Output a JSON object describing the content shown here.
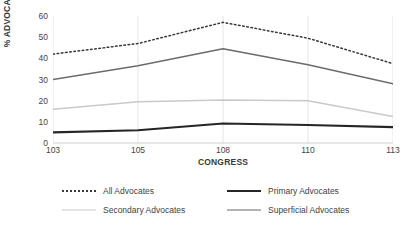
{
  "chart_data": {
    "type": "line",
    "title": "",
    "xlabel": "CONGRESS",
    "ylabel": "% ADVOCATES",
    "categories": [
      "103",
      "105",
      "108",
      "110",
      "113"
    ],
    "ylim": [
      0,
      60
    ],
    "yticks": [
      0,
      10,
      20,
      30,
      40,
      50,
      60
    ],
    "grid": "vertical",
    "legend_position": "bottom",
    "series": [
      {
        "name": "All Advocates",
        "values": [
          42,
          47,
          57,
          49.5,
          37.5
        ],
        "color": "#3a3a3a",
        "style": "dotted",
        "width": 1.5
      },
      {
        "name": "Primary Advocates",
        "values": [
          5,
          6,
          9.2,
          8.5,
          7.5
        ],
        "color": "#262626",
        "style": "solid",
        "width": 2.1
      },
      {
        "name": "Secondary Advocates",
        "values": [
          16,
          19.5,
          20.3,
          20,
          12.5
        ],
        "color": "#c9c9c9",
        "style": "solid",
        "width": 1.5
      },
      {
        "name": "Superficial Advocates",
        "values": [
          30,
          36.5,
          44.5,
          37,
          28
        ],
        "color": "#6b6b6b",
        "style": "solid",
        "width": 1.5
      }
    ]
  },
  "axes": {
    "y_title": "% ADVOCATES",
    "x_title": "CONGRESS",
    "y_tick_labels": [
      "60",
      "50",
      "40",
      "30",
      "20",
      "10",
      "0"
    ],
    "x_tick_labels": [
      "103",
      "105",
      "108",
      "110",
      "113"
    ]
  },
  "legend": {
    "entries": [
      {
        "label": "All Advocates"
      },
      {
        "label": "Primary Advocates"
      },
      {
        "label": "Secondary Advocates"
      },
      {
        "label": "Superficial Advocates"
      }
    ]
  },
  "colors": {
    "axis_line": "#d0d0d0",
    "gridline": "#e4e4e4",
    "text": "#3f3f3f"
  }
}
